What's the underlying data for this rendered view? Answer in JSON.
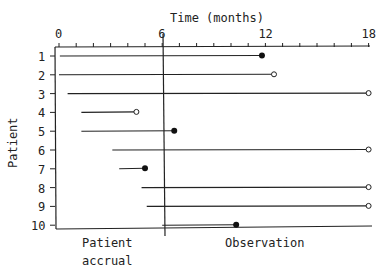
{
  "chart_data": {
    "type": "line",
    "title": "",
    "xlabel": "Time (months)",
    "ylabel": "Patient",
    "x_ticks": [
      0,
      6,
      12,
      18
    ],
    "xlim": [
      0,
      18
    ],
    "y_categories": [
      "1",
      "2",
      "3",
      "4",
      "5",
      "6",
      "7",
      "8",
      "9",
      "10"
    ],
    "divider_x": 6,
    "region_labels": {
      "left": [
        "Patient",
        "accrual"
      ],
      "right": "Observation"
    },
    "legend_meaning": {
      "filled_circle": "event",
      "open_circle": "censored"
    },
    "series": [
      {
        "patient": "1",
        "start": 0.05,
        "end": 11.8,
        "end_marker": "filled"
      },
      {
        "patient": "2",
        "start": 0.0,
        "end": 12.5,
        "end_marker": "open"
      },
      {
        "patient": "3",
        "start": 0.5,
        "end": 18.0,
        "end_marker": "open"
      },
      {
        "patient": "4",
        "start": 1.3,
        "end": 4.5,
        "end_marker": "open"
      },
      {
        "patient": "5",
        "start": 1.3,
        "end": 6.7,
        "end_marker": "filled"
      },
      {
        "patient": "6",
        "start": 3.1,
        "end": 18.0,
        "end_marker": "open"
      },
      {
        "patient": "7",
        "start": 3.5,
        "end": 5.0,
        "end_marker": "filled"
      },
      {
        "patient": "8",
        "start": 4.8,
        "end": 18.0,
        "end_marker": "open"
      },
      {
        "patient": "9",
        "start": 5.1,
        "end": 18.0,
        "end_marker": "open"
      },
      {
        "patient": "10",
        "start": 6.0,
        "end": 10.3,
        "end_marker": "filled"
      }
    ]
  }
}
